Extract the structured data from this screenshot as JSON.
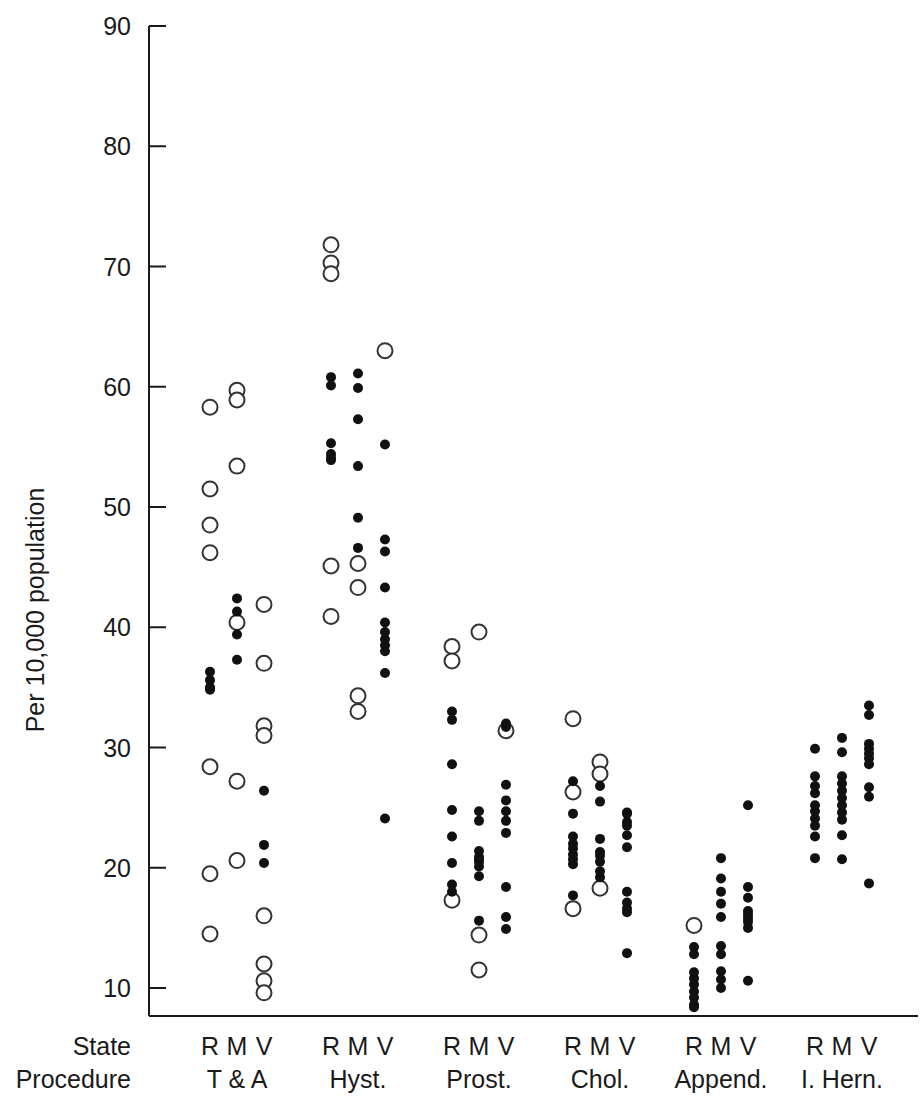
{
  "chart_data": {
    "type": "scatter",
    "title": "",
    "subtitle": "",
    "ylabel": "Per 10,000 population",
    "xlabel": "",
    "row_labels": [
      "State",
      "Procedure"
    ],
    "ylim": [
      8,
      90
    ],
    "yticks": [
      10,
      20,
      30,
      40,
      50,
      60,
      70,
      80,
      90
    ],
    "ytick_labels": [
      "10",
      "20",
      "30",
      "40",
      "50",
      "60",
      "70",
      "80",
      "90"
    ],
    "grid": false,
    "legend": "none",
    "marker_types": {
      "filled": "filled-circle",
      "open": "open-circle"
    },
    "state_codes": [
      "R",
      "M",
      "V"
    ],
    "procedures": [
      "T & A",
      "Hyst.",
      "Prost.",
      "Chol.",
      "Append.",
      "I. Hern."
    ],
    "groups": [
      {
        "procedure": "T & A",
        "columns": [
          {
            "state": "R",
            "marker": "open",
            "values": [
              58.3,
              51.5,
              48.5,
              46.2,
              28.4,
              19.5,
              14.5
            ]
          },
          {
            "state": "R",
            "marker": "filled",
            "values": [
              36.3,
              35.6,
              35.0,
              34.8,
              34.9
            ]
          },
          {
            "state": "M",
            "marker": "open",
            "values": [
              59.7,
              58.9,
              53.4,
              40.4,
              27.2,
              20.6
            ]
          },
          {
            "state": "M",
            "marker": "filled",
            "values": [
              42.4,
              41.3,
              39.4,
              37.3
            ]
          },
          {
            "state": "V",
            "marker": "open",
            "values": [
              41.9,
              37.0,
              31.8,
              31.0,
              16.0,
              12.0,
              10.6,
              9.6
            ]
          },
          {
            "state": "V",
            "marker": "filled",
            "values": [
              26.4,
              21.9,
              20.4
            ]
          }
        ]
      },
      {
        "procedure": "Hyst.",
        "columns": [
          {
            "state": "R",
            "marker": "open",
            "values": [
              71.8,
              70.3,
              69.4,
              45.1,
              40.9
            ]
          },
          {
            "state": "R",
            "marker": "filled",
            "values": [
              60.8,
              60.1,
              55.3,
              54.4,
              53.9,
              54.1
            ]
          },
          {
            "state": "M",
            "marker": "open",
            "values": [
              45.3,
              43.3,
              34.3,
              33.0
            ]
          },
          {
            "state": "M",
            "marker": "filled",
            "values": [
              61.1,
              59.9,
              57.3,
              53.4,
              49.1,
              46.6
            ]
          },
          {
            "state": "V",
            "marker": "open",
            "values": [
              63.0
            ]
          },
          {
            "state": "V",
            "marker": "filled",
            "values": [
              55.2,
              47.3,
              46.3,
              43.3,
              40.4,
              39.6,
              39.0,
              38.5,
              38.0,
              36.2,
              24.1
            ]
          }
        ]
      },
      {
        "procedure": "Prost.",
        "columns": [
          {
            "state": "R",
            "marker": "open",
            "values": [
              38.4,
              37.2,
              17.3
            ]
          },
          {
            "state": "R",
            "marker": "filled",
            "values": [
              33.0,
              32.3,
              28.6,
              24.8,
              22.6,
              20.4,
              18.6,
              18.0
            ]
          },
          {
            "state": "M",
            "marker": "open",
            "values": [
              39.6,
              14.4,
              11.5
            ]
          },
          {
            "state": "M",
            "marker": "filled",
            "values": [
              24.7,
              23.9,
              21.4,
              20.9,
              20.7,
              20.5,
              20.1,
              19.3,
              15.6
            ]
          },
          {
            "state": "V",
            "marker": "open",
            "values": [
              31.4
            ]
          },
          {
            "state": "V",
            "marker": "filled",
            "values": [
              32.0,
              31.7,
              26.9,
              25.6,
              24.7,
              23.9,
              22.9,
              18.4,
              15.9,
              14.9
            ]
          }
        ]
      },
      {
        "procedure": "Chol.",
        "columns": [
          {
            "state": "R",
            "marker": "open",
            "values": [
              32.4,
              26.3,
              16.6
            ]
          },
          {
            "state": "R",
            "marker": "filled",
            "values": [
              27.2,
              24.5,
              22.6,
              22.0,
              21.6,
              21.1,
              20.7,
              20.3,
              17.7
            ]
          },
          {
            "state": "M",
            "marker": "open",
            "values": [
              28.8,
              27.8,
              18.3
            ]
          },
          {
            "state": "M",
            "marker": "filled",
            "values": [
              26.8,
              25.5,
              22.4,
              21.3,
              21.0,
              20.5,
              19.7,
              19.2
            ]
          },
          {
            "state": "V",
            "marker": "open",
            "values": []
          },
          {
            "state": "V",
            "marker": "filled",
            "values": [
              24.6,
              24.5,
              23.8,
              23.5,
              22.7,
              21.7,
              18.0,
              17.1,
              16.6,
              16.3,
              12.9
            ]
          }
        ]
      },
      {
        "procedure": "Append.",
        "columns": [
          {
            "state": "R",
            "marker": "open",
            "values": [
              15.2
            ]
          },
          {
            "state": "R",
            "marker": "filled",
            "values": [
              13.4,
              12.8,
              11.3,
              10.8,
              10.3,
              9.7,
              9.2,
              8.6,
              8.4
            ]
          },
          {
            "state": "M",
            "marker": "open",
            "values": []
          },
          {
            "state": "M",
            "marker": "filled",
            "values": [
              20.8,
              19.1,
              18.0,
              17.0,
              15.9,
              13.5,
              12.8,
              11.4,
              10.7,
              10.0
            ]
          },
          {
            "state": "V",
            "marker": "open",
            "values": []
          },
          {
            "state": "V",
            "marker": "filled",
            "values": [
              25.2,
              18.4,
              17.5,
              16.4,
              16.1,
              15.8,
              15.5,
              15.0,
              10.6
            ]
          }
        ]
      },
      {
        "procedure": "I. Hern.",
        "columns": [
          {
            "state": "R",
            "marker": "open",
            "values": []
          },
          {
            "state": "R",
            "marker": "filled",
            "values": [
              29.9,
              27.6,
              26.8,
              26.2,
              25.2,
              24.7,
              24.1,
              23.5,
              22.6,
              20.8
            ]
          },
          {
            "state": "M",
            "marker": "open",
            "values": []
          },
          {
            "state": "M",
            "marker": "filled",
            "values": [
              30.8,
              29.6,
              27.6,
              27.0,
              26.4,
              25.8,
              25.2,
              24.6,
              24.0,
              22.7,
              20.7
            ]
          },
          {
            "state": "V",
            "marker": "open",
            "values": []
          },
          {
            "state": "V",
            "marker": "filled",
            "values": [
              33.5,
              32.7,
              30.3,
              29.9,
              29.5,
              29.1,
              28.6,
              26.7,
              25.9,
              18.7
            ]
          }
        ]
      }
    ]
  }
}
